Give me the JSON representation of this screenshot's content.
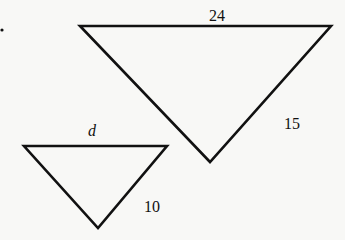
{
  "figure": {
    "large_triangle": {
      "top_side_label": "24",
      "right_side_label": "15",
      "points": "80,26 331,26 210,162"
    },
    "small_triangle": {
      "top_side_label": "d",
      "right_side_label": "10",
      "points": "24,146 167,146 98,228"
    },
    "stroke_color": "#111111",
    "background_color": "#f8f8f6"
  }
}
